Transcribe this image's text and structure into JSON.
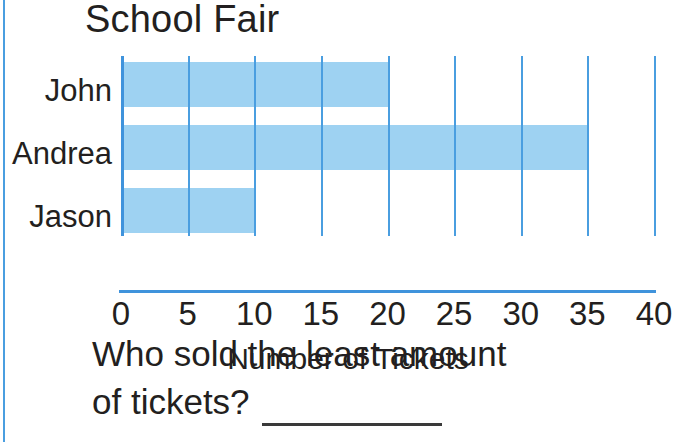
{
  "page": {
    "background_color": "#ffffff",
    "rule_color": "#4a9ee0"
  },
  "worksheet": {
    "title": "School Fair",
    "question_line_1": "Who sold the least amount",
    "question_line_2": "of tickets?",
    "answer_blank": ""
  },
  "chart_data": {
    "type": "bar",
    "orientation": "horizontal",
    "title": "School Fair",
    "categories": [
      "John",
      "Andrea",
      "Jason"
    ],
    "values": [
      20,
      35,
      10
    ],
    "xlabel": "Number of Tickets",
    "ylabel": "",
    "xlim": [
      0,
      40
    ],
    "xticks": [
      0,
      5,
      10,
      15,
      20,
      25,
      30,
      35,
      40
    ],
    "xtick_labels": [
      "0",
      "5",
      "10",
      "15",
      "20",
      "25",
      "30",
      "35",
      "40"
    ],
    "grid": true,
    "grid_axis": "x",
    "legend": false,
    "bar_color": "#9ed2f2",
    "grid_color": "#4a9ee0",
    "axis_color": "#3f93dc"
  }
}
